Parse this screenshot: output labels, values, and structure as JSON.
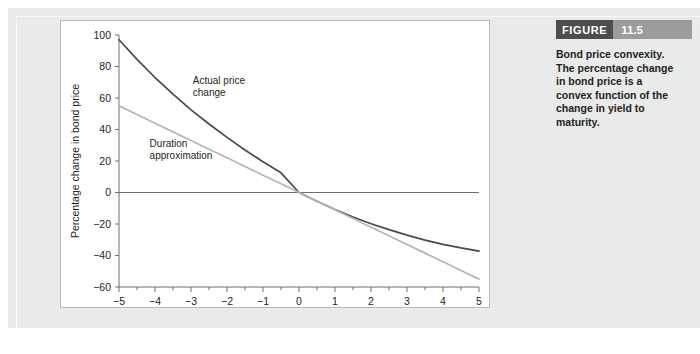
{
  "figure": {
    "label": "FIGURE",
    "number": "11.5",
    "caption": "Bond price convexity. The percentage change in bond price is a convex function of the change in yield to maturity."
  },
  "colors": {
    "page_background": "#ffffff",
    "panel_background": "#e9eaea",
    "plot_background": "#ffffff",
    "plot_border": "#b9babb",
    "axis": "#6e6f71",
    "actual_curve": "#4a4a4c",
    "duration_line": "#b4b5b6",
    "zero_line": "#6e6f71",
    "header_label_background": "#4d4d4d",
    "header_number_background": "#9b9c9c",
    "text": "#231f20"
  },
  "chart_data": {
    "type": "line",
    "title": "",
    "xlabel": "Change in yield to maturity (percentage points)",
    "ylabel": "Percentage change in bond price",
    "xlim": [
      -5,
      5
    ],
    "ylim": [
      -60,
      100
    ],
    "xticks": [
      -5,
      -4,
      -3,
      -2,
      -1,
      0,
      1,
      2,
      3,
      4,
      5
    ],
    "xticklabels": [
      "−5",
      "−4",
      "−3",
      "−2",
      "−1",
      "0",
      "1",
      "2",
      "3",
      "4",
      "5"
    ],
    "xminor_step": 0.5,
    "yticks": [
      -60,
      -40,
      -20,
      0,
      20,
      40,
      60,
      80,
      100
    ],
    "yticklabels": [
      "−60",
      "−40",
      "−20",
      "0",
      "20",
      "40",
      "60",
      "80",
      "100"
    ],
    "grid": false,
    "legend": "none",
    "zero_line_y": 0,
    "x": [
      -5,
      -4.5,
      -4,
      -3.5,
      -3,
      -2.5,
      -2,
      -1.5,
      -1,
      -0.5,
      0,
      0.5,
      1,
      1.5,
      2,
      2.5,
      3,
      3.5,
      4,
      4.5,
      5
    ],
    "series": [
      {
        "name": "Actual price change",
        "color": "#4a4a4c",
        "values": [
          97,
          84.5,
          73,
          62.5,
          52.5,
          43.5,
          35,
          27,
          19.5,
          12.5,
          0,
          -5.5,
          -10.8,
          -15.6,
          -19.8,
          -23.6,
          -27.1,
          -30.2,
          -32.9,
          -35.2,
          -37.2
        ]
      },
      {
        "name": "Duration approximation",
        "color": "#b4b5b6",
        "values": [
          55,
          49.5,
          44,
          38.5,
          33,
          27.5,
          22,
          16.5,
          11,
          5.5,
          0,
          -5.5,
          -11,
          -16.5,
          -22,
          -27.5,
          -33,
          -38.5,
          -44,
          -49.5,
          -55
        ]
      }
    ],
    "annotations": [
      {
        "text_line1": "Actual price",
        "text_line2": "change",
        "x": -2.95,
        "y": 69
      },
      {
        "text_line1": "Duration",
        "text_line2": "approximation",
        "x": -4.15,
        "y": 29
      }
    ]
  }
}
